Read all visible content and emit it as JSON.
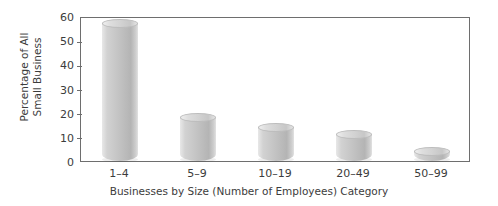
{
  "chart_data": {
    "type": "bar",
    "title": "",
    "subtitle": "",
    "xlabel": "Businesses by Size (Number of Employees) Category",
    "ylabel": "Percentage of All Small Business",
    "ylabel_lines": [
      "Percentage of All",
      "Small Business"
    ],
    "categories": [
      "1–4",
      "5–9",
      "10–19",
      "20–49",
      "50–99"
    ],
    "values": [
      57,
      18,
      14,
      11,
      4
    ],
    "ylim": [
      0,
      60
    ],
    "yticks": [
      0,
      10,
      20,
      30,
      40,
      50,
      60
    ],
    "ytick_labels": [
      "0",
      "10",
      "20",
      "30",
      "40",
      "50",
      "60"
    ],
    "grid": false,
    "legend": false,
    "legend_position": "none",
    "bar_style": "cylinder",
    "colors": {
      "bar_light": "#e8e8e8",
      "bar_mid": "#c9c9c9",
      "bar_dark": "#b4b4b4",
      "axis": "#6e6e6e",
      "text": "#3c3c3c",
      "background": "#ffffff"
    }
  }
}
